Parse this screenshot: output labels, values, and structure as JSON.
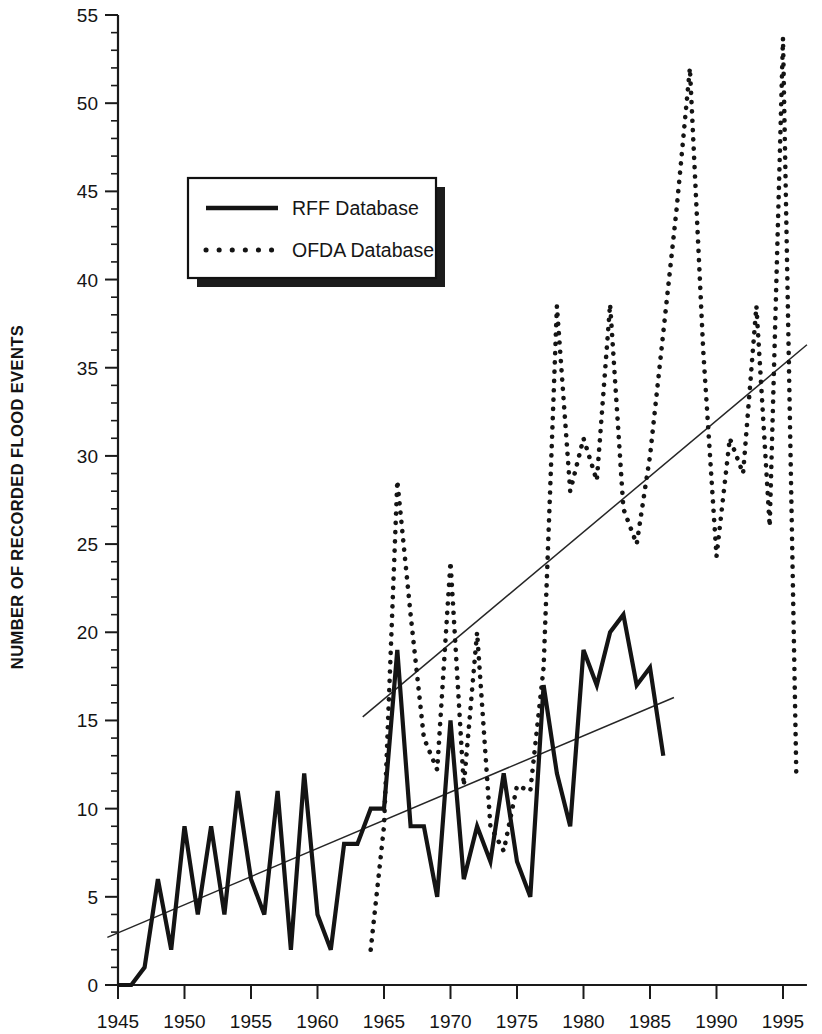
{
  "chart_data": {
    "type": "line",
    "title": "",
    "xlabel": "",
    "ylabel": "NUMBER OF RECORDED FLOOD EVENTS",
    "xlim": [
      1944.2,
      1996.8
    ],
    "ylim": [
      0,
      55
    ],
    "grid": false,
    "legend_position": "upper-left",
    "x_ticks": [
      1945,
      1950,
      1955,
      1960,
      1965,
      1970,
      1975,
      1980,
      1985,
      1990,
      1995
    ],
    "x_tick_labels": [
      "1945",
      "1950",
      "1955",
      "1960",
      "1965",
      "1970",
      "1975",
      "1980",
      "1985",
      "1990",
      "1995"
    ],
    "x_minor_tick_step": 1,
    "y_ticks": [
      0,
      5,
      10,
      15,
      20,
      25,
      30,
      35,
      40,
      45,
      50,
      55
    ],
    "y_tick_labels": [
      "0",
      "5",
      "10",
      "15",
      "20",
      "25",
      "30",
      "35",
      "40",
      "45",
      "50",
      "55"
    ],
    "y_minor_tick_step": 1,
    "series": [
      {
        "name": "RFF Database",
        "style": "solid",
        "color": "#141414",
        "x": [
          1945,
          1946,
          1947,
          1948,
          1949,
          1950,
          1951,
          1952,
          1953,
          1954,
          1955,
          1956,
          1957,
          1958,
          1959,
          1960,
          1961,
          1962,
          1963,
          1964,
          1965,
          1966,
          1967,
          1968,
          1969,
          1970,
          1971,
          1972,
          1973,
          1974,
          1975,
          1976,
          1977,
          1978,
          1979,
          1980,
          1981,
          1982,
          1983,
          1984,
          1985,
          1986
        ],
        "values": [
          0,
          0,
          1,
          6,
          2,
          9,
          4,
          9,
          4,
          11,
          6,
          4,
          11,
          2,
          12,
          4,
          2,
          8,
          8,
          10,
          10,
          19,
          9,
          9,
          5,
          15,
          6,
          9,
          7,
          12,
          7,
          5,
          17,
          12,
          9,
          19,
          17,
          20,
          21,
          17,
          18,
          13
        ]
      },
      {
        "name": "OFDA Database",
        "style": "dotted",
        "color": "#141414",
        "x": [
          1964,
          1965,
          1966,
          1967,
          1968,
          1969,
          1970,
          1971,
          1972,
          1973,
          1974,
          1975,
          1976,
          1977,
          1978,
          1979,
          1980,
          1981,
          1982,
          1983,
          1984,
          1985,
          1986,
          1987,
          1988,
          1989,
          1990,
          1991,
          1992,
          1993,
          1994,
          1995,
          1996
        ],
        "values": [
          2,
          9,
          28.6,
          21,
          14,
          12.2,
          24,
          11.3,
          20,
          9,
          7.6,
          11.3,
          11,
          18,
          38.5,
          28,
          31,
          28.6,
          38.6,
          27,
          25,
          30,
          37,
          44,
          52,
          36,
          24.3,
          31,
          29,
          38.5,
          26,
          53.7,
          12
        ]
      }
    ],
    "trend_lines": [
      {
        "name": "RFF trend",
        "for_series": "RFF Database",
        "x": [
          1944.2,
          1986.8
        ],
        "values": [
          2.7,
          16.3
        ]
      },
      {
        "name": "OFDA trend",
        "for_series": "OFDA Database",
        "x": [
          1963.4,
          1996.8
        ],
        "values": [
          15.2,
          36.3
        ]
      }
    ]
  },
  "legend": {
    "items": [
      {
        "label": "RFF Database",
        "style": "solid"
      },
      {
        "label": "OFDA Database",
        "style": "dotted"
      }
    ]
  }
}
